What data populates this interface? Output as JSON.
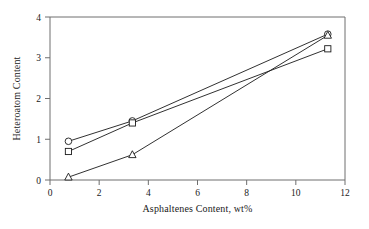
{
  "chart_data": {
    "type": "line",
    "title": "",
    "xlabel": "Asphaltenes Content, wt%",
    "ylabel": "Heteroatom Content",
    "xlim": [
      0,
      12
    ],
    "ylim": [
      0,
      4
    ],
    "xticks": [
      0,
      2,
      4,
      6,
      8,
      10,
      12
    ],
    "yticks": [
      0,
      1,
      2,
      3,
      4
    ],
    "xtick_labels": [
      "0",
      "2",
      "4",
      "6",
      "8",
      "10",
      "12"
    ],
    "ytick_labels": [
      "0",
      "1",
      "2",
      "3",
      "4"
    ],
    "grid": false,
    "legend": "none",
    "marker_fill": "#ffffff",
    "line_color": "#1a1a1a",
    "frame_color": "#6e6e6e",
    "series": [
      {
        "name": "circle-series",
        "marker": "circle",
        "x": [
          0.75,
          3.35,
          11.3
        ],
        "values": [
          0.95,
          1.45,
          3.58
        ]
      },
      {
        "name": "square-series",
        "marker": "square",
        "x": [
          0.75,
          3.35,
          11.3
        ],
        "values": [
          0.7,
          1.4,
          3.22
        ]
      },
      {
        "name": "triangle-series",
        "marker": "triangle",
        "x": [
          0.75,
          3.35,
          11.3
        ],
        "values": [
          0.07,
          0.62,
          3.55
        ]
      }
    ]
  }
}
